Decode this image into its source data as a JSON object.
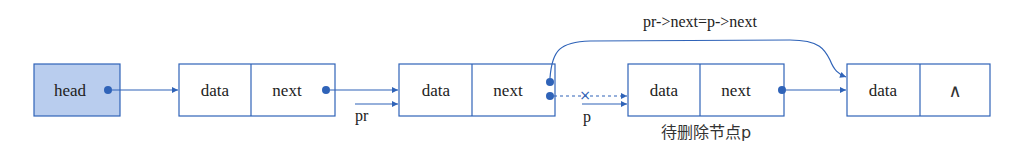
{
  "diagram": {
    "colors": {
      "line": "#2f63b8",
      "head_fill": "#b9cdee",
      "box_fill": "#ffffff",
      "text": "#222222"
    },
    "head": {
      "label": "head"
    },
    "nodes": [
      {
        "data": "data",
        "next": "next"
      },
      {
        "data": "data",
        "next": "next"
      },
      {
        "data": "data",
        "next": "next"
      },
      {
        "data": "data",
        "next": "∧"
      }
    ],
    "pointers": {
      "pr": "pr",
      "p": "p"
    },
    "annotation": "pr->next=p->next",
    "caption": "待删除节点p",
    "broken_link_mark": "×"
  }
}
